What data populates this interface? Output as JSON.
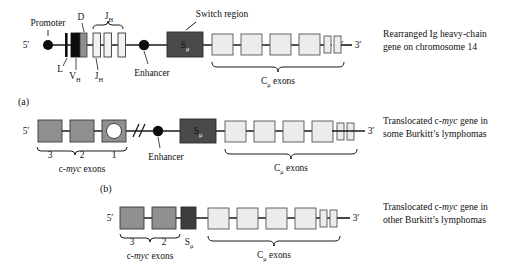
{
  "figure": {
    "title_row1": {
      "five_prime": "5′",
      "three_prime": "3′",
      "labels": {
        "promoter": "Promoter",
        "leader": "L",
        "vh": "V",
        "vh_sub": "H",
        "d": "D",
        "jh_top": "J",
        "jh_top_sub": "H",
        "jh_bottom": "J",
        "jh_bottom_sub": "H",
        "enhancer": "Enhancer",
        "switch_region": "Switch region",
        "smu": "S",
        "smu_sub": "μ",
        "cmu_exons": "C",
        "cmu_exons_sub": "μ",
        "cmu_exons_tail": " exons"
      },
      "caption_line1": "Rearranged Ig heavy-chain",
      "caption_line2": "gene on chromosome 14"
    },
    "panel_a": {
      "panel_label": "(a)",
      "five_prime": "5′",
      "three_prime": "3′",
      "exon_numbers": [
        "3",
        "2",
        "1"
      ],
      "cmyc_label_pre": "c-",
      "cmyc_label_it": "myc",
      "cmyc_label_post": " exons",
      "break_symbol": "//",
      "enhancer": "Enhancer",
      "smu": "S",
      "smu_sub": "μ",
      "cmu_exons": "C",
      "cmu_exons_sub": "μ",
      "cmu_exons_tail": " exons",
      "caption_line1_pre": "Translocated c-",
      "caption_line1_it": "myc",
      "caption_line1_post": " gene in",
      "caption_line2": "some Burkitt’s lymphomas"
    },
    "panel_b": {
      "panel_label": "(b)",
      "five_prime": "5′",
      "three_prime": "3′",
      "exon_numbers": [
        "3",
        "2"
      ],
      "cmyc_label_pre": "c-",
      "cmyc_label_it": "myc",
      "cmyc_label_post": " exons",
      "smu": "S",
      "smu_sub": "μ",
      "cmu_exons": "C",
      "cmu_exons_sub": "μ",
      "cmu_exons_tail": " exons",
      "caption_line1_pre": "Translocated c-",
      "caption_line1_it": "myc",
      "caption_line1_post": " gene in",
      "caption_line2": "other Burkitt’s lymphomas"
    }
  },
  "colors": {
    "line": "#1a1a1a",
    "black_box": "#0d0d0d",
    "dark_gray_box": "#4a4a4a",
    "mid_gray_box": "#8a8a8a",
    "light_gray_box": "#e4e4e4",
    "pale_box": "#ededed",
    "white": "#ffffff",
    "text": "#111111"
  }
}
